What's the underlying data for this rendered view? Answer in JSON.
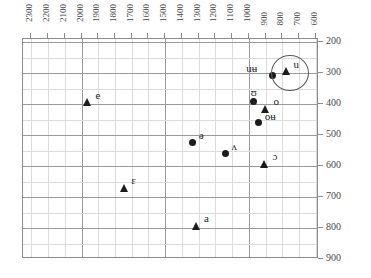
{
  "chart_data": {
    "type": "scatter",
    "title": "",
    "xlabel": "",
    "ylabel": "",
    "xlim": [
      2350,
      580
    ],
    "ylim": [
      900,
      190
    ],
    "x_reversed": true,
    "y_reversed": true,
    "grid": true,
    "legend": "none",
    "x_ticks": [
      2300,
      2200,
      2100,
      2000,
      1900,
      1800,
      1700,
      1600,
      1500,
      1400,
      1300,
      1200,
      1100,
      1000,
      900,
      800,
      700,
      600
    ],
    "y_ticks": [
      200,
      300,
      400,
      500,
      600,
      700,
      800,
      900
    ],
    "x_minor_step": 100,
    "y_minor_step": 100,
    "series": [
      {
        "name": "circle-series",
        "marker": "circle",
        "color": "#1c1c1c",
        "points": [
          {
            "label": "uʉ",
            "x": 860,
            "y": 307,
            "label_dx": -26,
            "label_dy": -12
          },
          {
            "label": "ʊ",
            "x": 970,
            "y": 390,
            "label_dx": -3,
            "label_dy": -14
          },
          {
            "label": "oʉ",
            "x": 940,
            "y": 458,
            "label_dx": 6,
            "label_dy": -11
          },
          {
            "label": "ə",
            "x": 1335,
            "y": 523,
            "label_dx": 6,
            "label_dy": -12
          },
          {
            "label": "ʌ",
            "x": 1140,
            "y": 560,
            "label_dx": 6,
            "label_dy": -13
          }
        ]
      },
      {
        "name": "triangle-series",
        "marker": "triangle",
        "color": "#1c1c1c",
        "points": [
          {
            "label": "u",
            "x": 775,
            "y": 293,
            "label_dx": 7,
            "label_dy": -12
          },
          {
            "label": "o",
            "x": 900,
            "y": 417,
            "label_dx": 8,
            "label_dy": -13
          },
          {
            "label": "ɔ",
            "x": 905,
            "y": 592,
            "label_dx": 8,
            "label_dy": -13
          },
          {
            "label": "e",
            "x": 1965,
            "y": 393,
            "label_dx": 8,
            "label_dy": -12
          },
          {
            "label": "ɛ",
            "x": 1745,
            "y": 672,
            "label_dx": 7,
            "label_dy": -13
          },
          {
            "label": "a",
            "x": 1310,
            "y": 793,
            "label_dx": 7,
            "label_dy": -13
          }
        ]
      }
    ],
    "annotations": [
      {
        "name": "highlight-ellipse",
        "shape": "ellipse",
        "center_x": 762,
        "center_y": 296,
        "radius_x_px": 18,
        "radius_y_px": 17,
        "stroke": "#5a5a5a"
      }
    ]
  },
  "colors": {
    "marker": "#1c1c1c",
    "grid_minor": "#dcdcdc",
    "grid_major": "#9a9a9a",
    "axis": "#8c8c8c",
    "text": "#3a3a3a",
    "background": "#ffffff"
  }
}
